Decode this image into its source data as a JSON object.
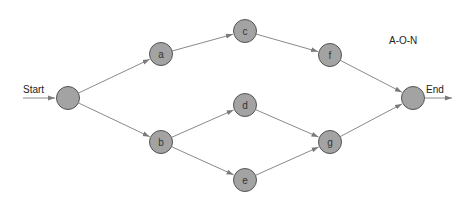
{
  "diagram": {
    "title": "A-O-N",
    "start_label": "Start",
    "end_label": "End",
    "colors": {
      "node_fill": "#a3a3a3",
      "node_stroke": "#555555",
      "edge": "#8a8a8a",
      "text": "#222222"
    },
    "nodes": [
      {
        "id": "start",
        "label": "",
        "x": 68,
        "y": 98
      },
      {
        "id": "a",
        "label": "a",
        "x": 161,
        "y": 54
      },
      {
        "id": "b",
        "label": "b",
        "x": 161,
        "y": 142
      },
      {
        "id": "c",
        "label": "c",
        "x": 245,
        "y": 31
      },
      {
        "id": "d",
        "label": "d",
        "x": 245,
        "y": 105
      },
      {
        "id": "e",
        "label": "e",
        "x": 245,
        "y": 180
      },
      {
        "id": "f",
        "label": "f",
        "x": 330,
        "y": 55
      },
      {
        "id": "g",
        "label": "g",
        "x": 330,
        "y": 142
      },
      {
        "id": "end",
        "label": "",
        "x": 413,
        "y": 98
      }
    ],
    "edges": [
      [
        "start",
        "a"
      ],
      [
        "start",
        "b"
      ],
      [
        "a",
        "c"
      ],
      [
        "b",
        "d"
      ],
      [
        "b",
        "e"
      ],
      [
        "c",
        "f"
      ],
      [
        "d",
        "g"
      ],
      [
        "e",
        "g"
      ],
      [
        "f",
        "end"
      ],
      [
        "g",
        "end"
      ]
    ]
  }
}
